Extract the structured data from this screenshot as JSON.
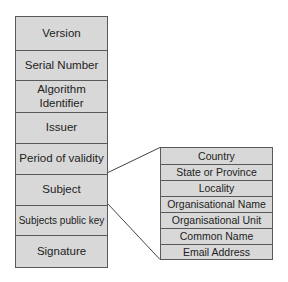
{
  "certificate_fields": [
    {
      "label": "Version"
    },
    {
      "label": "Serial Number"
    },
    {
      "label": "Algorithm Identifier"
    },
    {
      "label": "Issuer"
    },
    {
      "label": "Period of validity"
    },
    {
      "label": "Subject"
    },
    {
      "label": "Subjects public key"
    },
    {
      "label": "Signature"
    }
  ],
  "subject_fields": [
    {
      "label": "Country"
    },
    {
      "label": "State or Province"
    },
    {
      "label": "Locality"
    },
    {
      "label": "Organisational Name"
    },
    {
      "label": "Organisational Unit"
    },
    {
      "label": "Common Name"
    },
    {
      "label": "Email Address"
    }
  ],
  "colors": {
    "box_fill": "#d8d8d8",
    "border": "#5a5a5a",
    "connector": "#444444"
  }
}
